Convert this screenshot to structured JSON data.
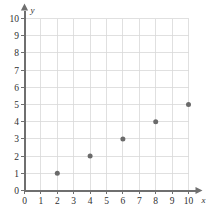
{
  "chart_data": {
    "type": "scatter",
    "title": "",
    "xlabel": "x",
    "ylabel": "y",
    "xlim": [
      0,
      10
    ],
    "ylim": [
      0,
      10
    ],
    "grid": true,
    "legend": null,
    "x_ticks": [
      "0",
      "1",
      "2",
      "3",
      "4",
      "5",
      "6",
      "7",
      "8",
      "9",
      "10"
    ],
    "y_ticks": [
      "0",
      "1",
      "2",
      "3",
      "4",
      "5",
      "6",
      "7",
      "8",
      "9",
      "10"
    ],
    "x": [
      2,
      4,
      6,
      8,
      10
    ],
    "y": [
      1,
      2,
      3,
      4,
      5
    ],
    "points": [
      {
        "x": 2,
        "y": 1
      },
      {
        "x": 4,
        "y": 2
      },
      {
        "x": 6,
        "y": 3
      },
      {
        "x": 8,
        "y": 4
      },
      {
        "x": 10,
        "y": 5
      }
    ],
    "colors": {
      "point": "#6a6a6a",
      "axis": "#6f6f6f",
      "grid": "#d8d8d8",
      "background": "#ffffff",
      "label": "#2f2f2f"
    }
  }
}
